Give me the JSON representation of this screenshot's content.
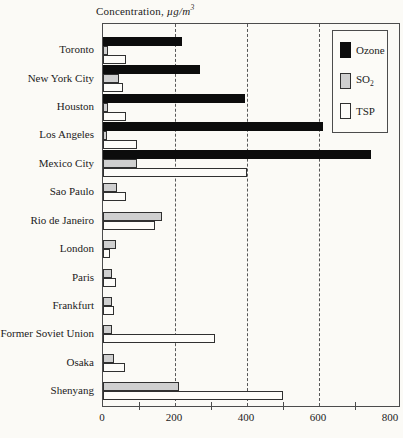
{
  "title": {
    "label": "Concentration, ",
    "unit": "µg/m",
    "unit_sup": "3"
  },
  "chart_data": {
    "type": "bar",
    "orientation": "horizontal",
    "categories": [
      "Toronto",
      "New York City",
      "Houston",
      "Los Angeles",
      "Mexico City",
      "Sao Paulo",
      "Rio de Janeiro",
      "London",
      "Paris",
      "Frankfurt",
      "Former Soviet Union",
      "Osaka",
      "Shenyang"
    ],
    "series": [
      {
        "name": "Ozone",
        "key": "ozone",
        "color": "#0c0c0c",
        "values": [
          220,
          270,
          395,
          610,
          745,
          null,
          null,
          null,
          null,
          null,
          null,
          null,
          null
        ]
      },
      {
        "name": "SO₂",
        "key": "so2",
        "color": "#cfcfcf",
        "values": [
          15,
          45,
          15,
          10,
          95,
          40,
          165,
          35,
          25,
          25,
          25,
          30,
          210
        ]
      },
      {
        "name": "TSP",
        "key": "tsp",
        "color": "#ffffff",
        "values": [
          65,
          55,
          65,
          95,
          400,
          65,
          145,
          20,
          35,
          30,
          310,
          60,
          500
        ]
      }
    ],
    "xlim": [
      0,
      800
    ],
    "x_ticks": [
      0,
      200,
      400,
      600,
      800
    ],
    "minor_ticks": [
      100,
      300,
      500,
      700
    ],
    "gridlines": [
      200,
      400,
      600
    ],
    "grid_style": "dashed",
    "legend_position": "top-right",
    "xlabel": "",
    "ylabel": ""
  },
  "legend": {
    "items": [
      {
        "key": "ozone",
        "label": "Ozone",
        "label_sub": ""
      },
      {
        "key": "so2",
        "label": "SO",
        "label_sub": "2"
      },
      {
        "key": "tsp",
        "label": "TSP",
        "label_sub": ""
      }
    ]
  }
}
